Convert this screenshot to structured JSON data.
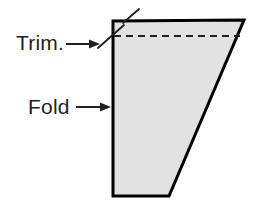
{
  "figure": {
    "background_color": "#ffffff",
    "shape": {
      "name": "folded-sheet-quadrilateral",
      "fill_color": "#e2e2e2",
      "stroke_color": "#000000",
      "stroke_width": 3,
      "vertices": [
        {
          "x": 113,
          "y": 21
        },
        {
          "x": 244,
          "y": 20
        },
        {
          "x": 169,
          "y": 196
        },
        {
          "x": 113,
          "y": 196
        }
      ]
    },
    "trim_dashed_line": {
      "name": "trim-dashed-line",
      "color": "#231f20",
      "dash_pattern": "7 5",
      "stroke_width": 2,
      "x1": 114,
      "y1": 36,
      "x2": 240,
      "y2": 36
    },
    "trim_ticks": [
      {
        "name": "trim-tick-upper",
        "x1": 123,
        "y1": 23,
        "x2": 139,
        "y2": 9
      },
      {
        "name": "trim-tick-lower",
        "x1": 98,
        "y1": 48,
        "x2": 124,
        "y2": 25
      }
    ],
    "labels": [
      {
        "id": "trim",
        "text": "Trim.",
        "text_x": 16,
        "text_y": 50,
        "arrow": {
          "name": "trim-arrow",
          "x1": 66,
          "y1": 44,
          "x2": 100,
          "y2": 44,
          "color": "#231f20",
          "stroke_width": 2,
          "head_width": 11,
          "head_height": 9
        }
      },
      {
        "id": "fold",
        "text": "Fold",
        "text_x": 28,
        "text_y": 114,
        "arrow": {
          "name": "fold-arrow",
          "x1": 76,
          "y1": 107,
          "x2": 111,
          "y2": 107,
          "color": "#231f20",
          "stroke_width": 2,
          "head_width": 11,
          "head_height": 9
        }
      }
    ]
  }
}
